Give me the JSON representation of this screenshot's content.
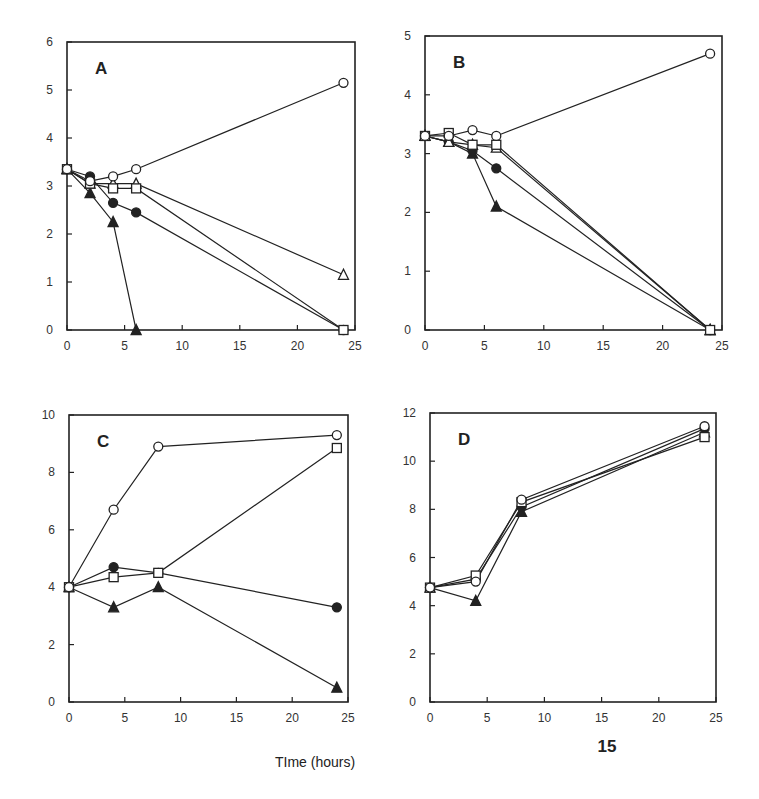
{
  "figure": {
    "xlabel": "TIme (hours)",
    "page_number": "15"
  },
  "chart_data": [
    {
      "type": "line",
      "panel": "A",
      "title": "A",
      "xlabel": "TIme (hours)",
      "ylabel": "",
      "xlim": [
        0,
        25
      ],
      "ylim": [
        0,
        6
      ],
      "xticks": [
        0,
        5,
        10,
        15,
        20,
        25
      ],
      "yticks": [
        0,
        1,
        2,
        3,
        4,
        5,
        6
      ],
      "grid": false,
      "legend": null,
      "series": [
        {
          "name": "open circle",
          "marker": "circle-open",
          "x": [
            0,
            2,
            4,
            6,
            24
          ],
          "y": [
            3.35,
            3.1,
            3.2,
            3.35,
            5.15
          ]
        },
        {
          "name": "filled circle",
          "marker": "circle-filled",
          "x": [
            0,
            2,
            4,
            6,
            24
          ],
          "y": [
            3.35,
            3.2,
            2.65,
            2.45,
            0
          ]
        },
        {
          "name": "open square",
          "marker": "square-open",
          "x": [
            0,
            2,
            4,
            6,
            24
          ],
          "y": [
            3.35,
            3.05,
            2.95,
            2.95,
            0
          ]
        },
        {
          "name": "open triangle",
          "marker": "triangle-open",
          "x": [
            0,
            2,
            4,
            6,
            24
          ],
          "y": [
            3.35,
            3.05,
            3.05,
            3.05,
            1.15
          ]
        },
        {
          "name": "filled triangle",
          "marker": "triangle-filled",
          "x": [
            0,
            2,
            4,
            6
          ],
          "y": [
            3.35,
            2.85,
            2.25,
            0
          ]
        }
      ]
    },
    {
      "type": "line",
      "panel": "B",
      "title": "B",
      "xlabel": "TIme (hours)",
      "ylabel": "",
      "xlim": [
        0,
        25
      ],
      "ylim": [
        0,
        5
      ],
      "xticks": [
        0,
        5,
        10,
        15,
        20,
        25
      ],
      "yticks": [
        0,
        1,
        2,
        3,
        4,
        5
      ],
      "grid": false,
      "legend": null,
      "series": [
        {
          "name": "open circle",
          "marker": "circle-open",
          "x": [
            0,
            2,
            4,
            6,
            24
          ],
          "y": [
            3.3,
            3.3,
            3.4,
            3.3,
            4.7
          ]
        },
        {
          "name": "filled circle",
          "marker": "circle-filled",
          "x": [
            0,
            2,
            4,
            6,
            24
          ],
          "y": [
            3.3,
            3.2,
            3.05,
            2.75,
            0
          ]
        },
        {
          "name": "open square",
          "marker": "square-open",
          "x": [
            0,
            2,
            4,
            6,
            24
          ],
          "y": [
            3.3,
            3.35,
            3.15,
            3.15,
            0
          ]
        },
        {
          "name": "open triangle",
          "marker": "triangle-open",
          "x": [
            0,
            2,
            4,
            6,
            24
          ],
          "y": [
            3.3,
            3.2,
            3.15,
            3.1,
            0
          ]
        },
        {
          "name": "filled triangle",
          "marker": "triangle-filled",
          "x": [
            0,
            2,
            4,
            6,
            24
          ],
          "y": [
            3.3,
            3.2,
            3.0,
            2.1,
            0
          ]
        }
      ]
    },
    {
      "type": "line",
      "panel": "C",
      "title": "C",
      "xlabel": "TIme (hours)",
      "ylabel": "",
      "xlim": [
        0,
        25
      ],
      "ylim": [
        0,
        10
      ],
      "xticks": [
        0,
        5,
        10,
        15,
        20,
        25
      ],
      "yticks": [
        0,
        2,
        4,
        6,
        8,
        10
      ],
      "grid": false,
      "legend": null,
      "series": [
        {
          "name": "open circle",
          "marker": "circle-open",
          "x": [
            0,
            4,
            8,
            24
          ],
          "y": [
            4.0,
            6.7,
            8.9,
            9.3
          ]
        },
        {
          "name": "filled circle",
          "marker": "circle-filled",
          "x": [
            0,
            4,
            8,
            24
          ],
          "y": [
            4.0,
            4.7,
            4.5,
            3.3
          ]
        },
        {
          "name": "open square",
          "marker": "square-open",
          "x": [
            0,
            4,
            8,
            24
          ],
          "y": [
            4.0,
            4.35,
            4.5,
            8.85
          ]
        },
        {
          "name": "filled triangle",
          "marker": "triangle-filled",
          "x": [
            0,
            4,
            8,
            24
          ],
          "y": [
            4.0,
            3.3,
            4.0,
            0.5
          ]
        }
      ]
    },
    {
      "type": "line",
      "panel": "D",
      "title": "D",
      "xlabel": "TIme (hours)",
      "ylabel": "",
      "xlim": [
        0,
        25
      ],
      "ylim": [
        0,
        12
      ],
      "xticks": [
        0,
        5,
        10,
        15,
        20,
        25
      ],
      "yticks": [
        0,
        2,
        4,
        6,
        8,
        10,
        12
      ],
      "grid": false,
      "legend": null,
      "series": [
        {
          "name": "open circle",
          "marker": "circle-open",
          "x": [
            0,
            4,
            8,
            24
          ],
          "y": [
            4.75,
            5.0,
            8.4,
            11.45
          ]
        },
        {
          "name": "filled circle",
          "marker": "circle-filled",
          "x": [
            0,
            4,
            8,
            24
          ],
          "y": [
            4.75,
            5.1,
            8.1,
            11.35
          ]
        },
        {
          "name": "open square",
          "marker": "square-open",
          "x": [
            0,
            4,
            8,
            24
          ],
          "y": [
            4.75,
            5.25,
            8.3,
            11.0
          ]
        },
        {
          "name": "filled triangle",
          "marker": "triangle-filled",
          "x": [
            0,
            4,
            8,
            24
          ],
          "y": [
            4.75,
            4.2,
            7.9,
            11.2
          ]
        }
      ]
    }
  ],
  "layout": {
    "panels": [
      {
        "x0": 67,
        "x1": 355,
        "y0": 330,
        "y1": 42
      },
      {
        "x0": 425,
        "x1": 722,
        "y0": 330,
        "y1": 36
      },
      {
        "x0": 69,
        "x1": 348,
        "y0": 702,
        "y1": 415
      },
      {
        "x0": 430,
        "x1": 716,
        "y0": 702,
        "y1": 413
      }
    ],
    "xlabel_pos": {
      "x": 315,
      "y": 767
    },
    "page_num_pos": {
      "x": 607,
      "y": 752
    }
  },
  "colors": {
    "ink": "#222222",
    "background": "#ffffff"
  }
}
